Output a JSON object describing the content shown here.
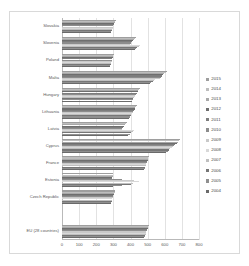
{
  "chart_data": {
    "type": "bar",
    "orientation": "horizontal",
    "title": "",
    "xlabel": "",
    "ylabel": "",
    "xlim": [
      0,
      800
    ],
    "xticks": [
      0,
      100,
      200,
      300,
      400,
      500,
      600,
      700,
      800
    ],
    "xtick_labels": [
      "0",
      "100",
      "200",
      "300",
      "400",
      "500",
      "600",
      "700",
      "800"
    ],
    "grid": true,
    "legend_position": "right",
    "categories": [
      "Slovakia",
      "Slovenia",
      "Poland",
      "Malta",
      "Hungary",
      "Lithuania",
      "Latvia",
      "Cyprus",
      "France",
      "Estonia",
      "Czech Republic",
      "",
      "EU (28 countries)"
    ],
    "series": [
      {
        "name": "2015",
        "color": "#9e9e9e",
        "values": [
          318,
          430,
          305,
          612,
          455,
          438,
          378,
          688,
          508,
          300,
          312,
          null,
          508
        ]
      },
      {
        "name": "2014",
        "color": "#bdbdbd",
        "values": [
          312,
          425,
          300,
          605,
          450,
          432,
          372,
          682,
          505,
          298,
          308,
          null,
          505
        ]
      },
      {
        "name": "2013",
        "color": "#a8a8a8",
        "values": [
          308,
          420,
          298,
          598,
          446,
          428,
          368,
          676,
          502,
          295,
          305,
          null,
          502
        ]
      },
      {
        "name": "2012",
        "color": "#6e6e6e",
        "values": [
          305,
          415,
          296,
          592,
          442,
          424,
          362,
          670,
          500,
          292,
          303,
          null,
          500
        ]
      },
      {
        "name": "2011",
        "color": "#7d7d7d",
        "values": [
          302,
          408,
          294,
          585,
          438,
          420,
          358,
          662,
          498,
          290,
          300,
          null,
          498
        ]
      },
      {
        "name": "2010",
        "color": "#8c8c8c",
        "values": [
          300,
          402,
          292,
          578,
          432,
          416,
          352,
          655,
          495,
          352,
          298,
          null,
          495
        ]
      },
      {
        "name": "2009",
        "color": "#c9c9c9",
        "values": [
          298,
          398,
          290,
          570,
          428,
          412,
          348,
          648,
          492,
          420,
          296,
          null,
          492
        ]
      },
      {
        "name": "2008",
        "color": "#d8d8d8",
        "values": [
          296,
          455,
          288,
          545,
          424,
          408,
          420,
          640,
          490,
          450,
          294,
          null,
          490
        ]
      },
      {
        "name": "2007",
        "color": "#bfbfbf",
        "values": [
          294,
          448,
          286,
          538,
          420,
          404,
          412,
          632,
          488,
          412,
          292,
          null,
          488
        ]
      },
      {
        "name": "2006",
        "color": "#767676",
        "values": [
          290,
          440,
          284,
          530,
          416,
          400,
          404,
          625,
          485,
          400,
          290,
          null,
          485
        ]
      },
      {
        "name": "2005",
        "color": "#8f8f8f",
        "values": [
          288,
          432,
          282,
          522,
          412,
          396,
          396,
          618,
          482,
          352,
          288,
          null,
          482
        ]
      },
      {
        "name": "2004",
        "color": "#6a6a6a",
        "values": [
          285,
          425,
          280,
          515,
          408,
          392,
          388,
          610,
          480,
          300,
          285,
          null,
          480
        ]
      }
    ]
  },
  "legend": {
    "entries": [
      "2015",
      "2014",
      "2013",
      "2012",
      "2011",
      "2010",
      "2009",
      "2008",
      "2007",
      "2006",
      "2005",
      "2004"
    ]
  }
}
